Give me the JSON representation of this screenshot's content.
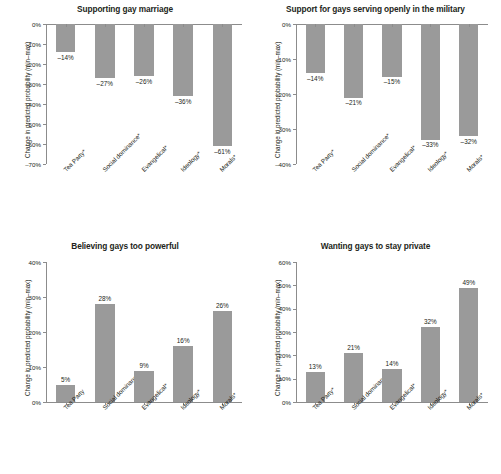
{
  "figure": {
    "axis_color": "#8c8c8c",
    "bar_color": "#9a9a9a",
    "text_color": "#231f20",
    "ylabel": "Change in predicted probability (min–max)"
  },
  "chart_data": [
    {
      "id": "supporting-gay-marriage",
      "type": "bar",
      "title": "Supporting gay marriage",
      "xlabel": "",
      "ylabel": "Change in predicted probability (min–max)",
      "categories": [
        "Tea Party*",
        "Social dominance*",
        "Evangelical*",
        "Ideology*",
        "Morals*"
      ],
      "values": [
        -14,
        -27,
        -26,
        -36,
        -61
      ],
      "value_labels": [
        "–14%",
        "–27%",
        "–26%",
        "–36%",
        "–61%"
      ],
      "ylim": [
        -70,
        0
      ],
      "yticks": [
        0,
        -10,
        -20,
        -30,
        -40,
        -50,
        -60,
        -70
      ],
      "ytick_labels": [
        "0%",
        "–10%",
        "–20%",
        "–30%",
        "–40%",
        "–50%",
        "–60%",
        "–70%"
      ],
      "grid": false,
      "legend": false
    },
    {
      "id": "support-gays-military",
      "type": "bar",
      "title": "Support for gays serving openly in the military",
      "xlabel": "",
      "ylabel": "Change in predicted probability (min–max)",
      "categories": [
        "Tea Party*",
        "Social dominance*",
        "Evangelical*",
        "Ideology*",
        "Morals*"
      ],
      "values": [
        -14,
        -21,
        -15,
        -33,
        -32
      ],
      "value_labels": [
        "–14%",
        "–21%",
        "–15%",
        "–33%",
        "–32%"
      ],
      "ylim": [
        -40,
        0
      ],
      "yticks": [
        0,
        -10,
        -20,
        -30,
        -40
      ],
      "ytick_labels": [
        "0%",
        "–10%",
        "–20%",
        "–30%",
        "–40%"
      ],
      "grid": false,
      "legend": false
    },
    {
      "id": "believing-gays-too-powerful",
      "type": "bar",
      "title": "Believing gays too powerful",
      "xlabel": "",
      "ylabel": "Change in predicted probability (min–max)",
      "categories": [
        "Tea Party",
        "Social dominance*",
        "Evangelical*",
        "Ideology*",
        "Morals*"
      ],
      "values": [
        5,
        28,
        9,
        16,
        26
      ],
      "value_labels": [
        "5%",
        "28%",
        "9%",
        "16%",
        "26%"
      ],
      "ylim": [
        0,
        40
      ],
      "yticks": [
        0,
        10,
        20,
        30,
        40
      ],
      "ytick_labels": [
        "0%",
        "10%",
        "20%",
        "30%",
        "40%"
      ],
      "grid": false,
      "legend": false
    },
    {
      "id": "wanting-gays-to-stay-private",
      "type": "bar",
      "title": "Wanting gays to stay private",
      "xlabel": "",
      "ylabel": "Change in predicted probability (min–max)",
      "categories": [
        "Tea Party*",
        "Social dominance",
        "Evangelical*",
        "Ideology*",
        "Morals*"
      ],
      "values": [
        13,
        21,
        14,
        32,
        49
      ],
      "value_labels": [
        "13%",
        "21%",
        "14%",
        "32%",
        "49%"
      ],
      "ylim": [
        0,
        60
      ],
      "yticks": [
        0,
        10,
        20,
        30,
        40,
        50,
        60
      ],
      "ytick_labels": [
        "0%",
        "10%",
        "20%",
        "30%",
        "40%",
        "50%",
        "60%"
      ],
      "grid": false,
      "legend": false
    }
  ]
}
